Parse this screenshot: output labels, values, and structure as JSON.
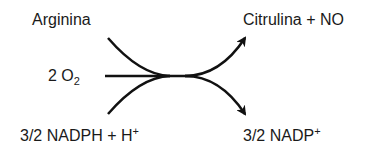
{
  "reaction": {
    "reactants": {
      "arginine": "Arginina",
      "oxygen_coef": "2 O",
      "oxygen_sub": "2",
      "nadph": "3/2 NADPH + H",
      "nadph_sup": "+"
    },
    "products": {
      "citrulline_no": "Citrulina + NO",
      "nadp": "3/2 NADP",
      "nadp_sup": "+"
    }
  },
  "colors": {
    "stroke": "#111111",
    "text": "#1a1a1a",
    "background": "#ffffff"
  }
}
